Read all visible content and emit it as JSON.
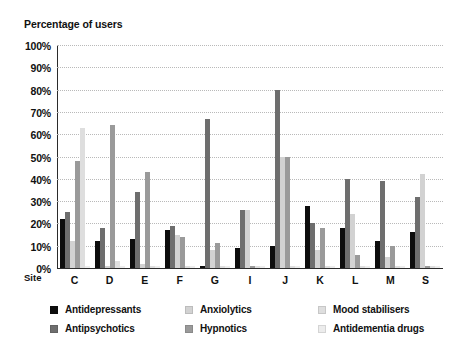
{
  "chart_data": {
    "type": "bar",
    "title": "",
    "ylabel": "Percentage of users",
    "xlabel": "Site",
    "ylim": [
      0,
      100
    ],
    "ytick_labels": [
      "0%",
      "10%",
      "20%",
      "30%",
      "40%",
      "50%",
      "60%",
      "70%",
      "80%",
      "90%",
      "100%"
    ],
    "ytick_values": [
      0,
      10,
      20,
      30,
      40,
      50,
      60,
      70,
      80,
      90,
      100
    ],
    "grid": true,
    "legend_position": "bottom",
    "categories": [
      "C",
      "D",
      "E",
      "F",
      "G",
      "I",
      "J",
      "K",
      "L",
      "M",
      "S"
    ],
    "series": [
      {
        "name": "Antidepressants",
        "color": "#0d0d0d",
        "values": [
          22,
          12,
          13,
          17,
          1,
          9,
          10,
          28,
          18,
          12,
          16
        ]
      },
      {
        "name": "Antipsychotics",
        "color": "#6e6e6e",
        "values": [
          25,
          18,
          34,
          19,
          67,
          26,
          80,
          20,
          40,
          39,
          32
        ]
      },
      {
        "name": "Anxiolytics",
        "color": "#d2d2d2",
        "values": [
          12,
          1,
          2,
          15,
          8,
          26,
          50,
          8,
          24,
          5,
          42
        ]
      },
      {
        "name": "Hypnotics",
        "color": "#9a9a9a",
        "values": [
          48,
          64,
          43,
          14,
          11,
          1,
          50,
          18,
          6,
          10,
          1
        ]
      },
      {
        "name": "Mood stabilisers",
        "color": "#dedede",
        "values": [
          63,
          3,
          1,
          1,
          1,
          1,
          1,
          1,
          1,
          1,
          1
        ]
      },
      {
        "name": "Antidementia drugs",
        "color": "#ececec",
        "values": [
          1,
          1,
          1,
          1,
          1,
          1,
          1,
          1,
          1,
          1,
          1
        ]
      }
    ]
  }
}
